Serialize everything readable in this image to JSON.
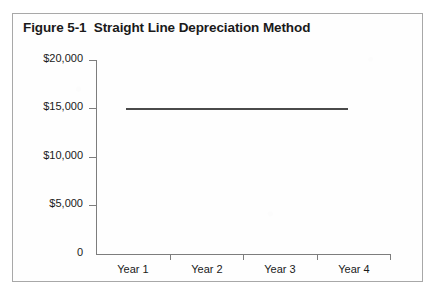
{
  "figure": {
    "title": "Figure 5-1  Straight Line Depreciation Method"
  },
  "chart_data": {
    "type": "line",
    "title": "Figure 5-1  Straight Line Depreciation Method",
    "xlabel": "",
    "ylabel": "",
    "categories": [
      "Year 1",
      "Year 2",
      "Year 3",
      "Year 4"
    ],
    "series": [
      {
        "name": "Straight Line Depreciation",
        "values": [
          15000,
          15000,
          15000,
          15000
        ]
      }
    ],
    "ylim": [
      0,
      20000
    ],
    "yticks": [
      0,
      5000,
      10000,
      15000,
      20000
    ],
    "ytick_labels": [
      "0",
      "$5,000",
      "$10,000",
      "$15,000",
      "$20,000"
    ],
    "grid": false,
    "legend": "none",
    "line_color": "#4a4a4a",
    "axis_color": "#7d7d7d"
  }
}
